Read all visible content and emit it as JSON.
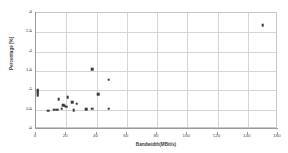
{
  "chart_data": {
    "type": "scatter",
    "title": "",
    "xlabel": "Bandwidth(MBit/s)",
    "ylabel": "Percentage [%]",
    "xlim": [
      0,
      160
    ],
    "ylim": [
      0,
      3
    ],
    "xticks": [
      0,
      20,
      40,
      60,
      80,
      100,
      120,
      140,
      160
    ],
    "yticks": [
      0,
      0.5,
      1,
      1.5,
      2,
      2.5,
      3
    ],
    "xtick_labels": [
      "0",
      "20",
      "40",
      "60",
      "80",
      "100",
      "120",
      "140",
      "160"
    ],
    "ytick_labels": [
      "0",
      "0.5",
      "1",
      "1.5",
      "2",
      "2.5",
      "3"
    ],
    "grid": true,
    "grid_axis": "both",
    "legend": false,
    "marker_color": "#3a3a3a",
    "marker_shape": "square",
    "points": [
      {
        "x": 1,
        "y": 1.0
      },
      {
        "x": 1,
        "y": 0.97
      },
      {
        "x": 1,
        "y": 0.93
      },
      {
        "x": 1,
        "y": 0.88
      },
      {
        "x": 8,
        "y": 0.47
      },
      {
        "x": 12,
        "y": 0.5
      },
      {
        "x": 14,
        "y": 0.5
      },
      {
        "x": 15,
        "y": 0.77
      },
      {
        "x": 17,
        "y": 0.52
      },
      {
        "x": 18,
        "y": 0.62
      },
      {
        "x": 19,
        "y": 0.6
      },
      {
        "x": 20,
        "y": 0.58
      },
      {
        "x": 21,
        "y": 0.82
      },
      {
        "x": 24,
        "y": 0.7
      },
      {
        "x": 25,
        "y": 0.48
      },
      {
        "x": 27,
        "y": 0.65
      },
      {
        "x": 33,
        "y": 0.51
      },
      {
        "x": 37,
        "y": 1.55
      },
      {
        "x": 37,
        "y": 0.52
      },
      {
        "x": 41,
        "y": 0.9
      },
      {
        "x": 48,
        "y": 1.27
      },
      {
        "x": 48,
        "y": 0.53
      },
      {
        "x": 150,
        "y": 2.68
      }
    ]
  }
}
